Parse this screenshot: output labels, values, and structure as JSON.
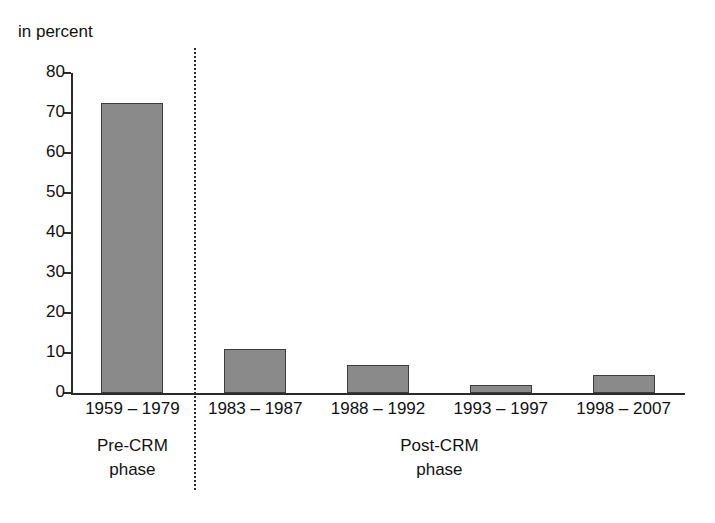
{
  "chart_data": {
    "type": "bar",
    "title": "",
    "subtitle": "",
    "xlabel": "",
    "ylabel": "in percent",
    "ylim": [
      0,
      80
    ],
    "ytick_step": 10,
    "grid": false,
    "legend": null,
    "categories": [
      "1959 – 1979",
      "1983 – 1987",
      "1988 – 1992",
      "1993 – 1997",
      "1998 – 2007"
    ],
    "values": [
      72.5,
      11,
      7,
      2,
      4.5
    ],
    "ytick_labels": [
      "80",
      "70",
      "60",
      "50",
      "40",
      "30",
      "20",
      "10",
      "0"
    ],
    "ytick_values": [
      80,
      70,
      60,
      50,
      40,
      30,
      20,
      10,
      0
    ],
    "annotations": [
      {
        "name": "pre-crm-phase",
        "line1": "Pre-CRM",
        "line2": "phase",
        "covers": [
          "1959 – 1979"
        ]
      },
      {
        "name": "post-crm-phase",
        "line1": "Post-CRM",
        "line2": "phase",
        "covers": [
          "1983 – 1987",
          "1988 – 1992",
          "1993 – 1997",
          "1998 – 2007"
        ]
      }
    ],
    "divider": {
      "after_category_index": 0,
      "style": "dotted"
    },
    "colors": {
      "bar_fill": "#8a8a8a",
      "bar_stroke": "#3d3d3d",
      "axis": "#2a2a2a",
      "text": "#111111",
      "background": "#ffffff"
    }
  },
  "axis": {
    "unit_label": "in percent"
  }
}
